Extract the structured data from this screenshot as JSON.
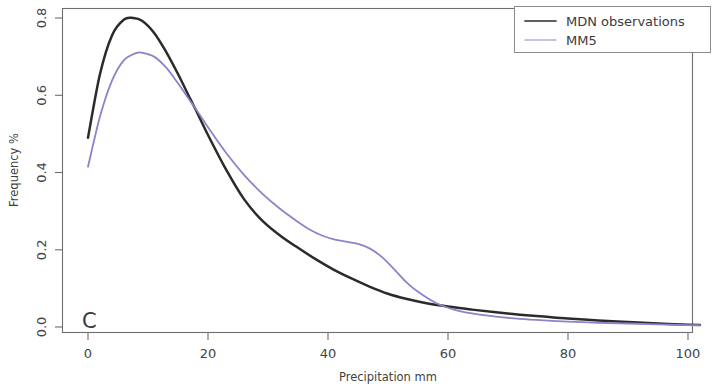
{
  "chart_data": {
    "type": "line",
    "title": "",
    "panel_label": "C",
    "xlabel": "Precipitation mm",
    "ylabel": "Frequency %",
    "xlim": [
      -2,
      104
    ],
    "ylim": [
      -0.02,
      0.84
    ],
    "xticks": [
      0,
      20,
      40,
      60,
      80,
      100
    ],
    "xtick_labels": [
      "0",
      "20",
      "40",
      "60",
      "80",
      "100"
    ],
    "yticks": [
      0.0,
      0.2,
      0.4,
      0.6,
      0.8
    ],
    "ytick_labels": [
      "0.0",
      "0.2",
      "0.4",
      "0.6",
      "0.8"
    ],
    "grid": false,
    "legend_position": "top-right",
    "series": [
      {
        "name": "MDN observations",
        "color": "#2b2b2b",
        "width": 2.5,
        "x": [
          0,
          2,
          4,
          6,
          7.5,
          9,
          11,
          13,
          15,
          17,
          18,
          20,
          23,
          26,
          29,
          32,
          35,
          38,
          41,
          44,
          47,
          50,
          53,
          56,
          60,
          64,
          68,
          72,
          76,
          80,
          85,
          90,
          95,
          100,
          102
        ],
        "y": [
          0.49,
          0.655,
          0.755,
          0.796,
          0.8,
          0.793,
          0.762,
          0.713,
          0.655,
          0.592,
          0.561,
          0.497,
          0.408,
          0.331,
          0.276,
          0.237,
          0.205,
          0.175,
          0.148,
          0.125,
          0.104,
          0.086,
          0.073,
          0.063,
          0.053,
          0.045,
          0.038,
          0.032,
          0.027,
          0.022,
          0.017,
          0.013,
          0.009,
          0.006,
          0.005
        ]
      },
      {
        "name": "MM5",
        "color": "#8a84c8",
        "width": 1.8,
        "x": [
          0,
          2,
          4,
          6,
          8,
          9,
          11,
          13,
          15,
          17,
          18,
          20,
          23,
          26,
          29,
          32,
          35,
          37,
          39,
          41,
          43,
          45,
          47,
          49,
          51,
          53,
          55,
          58,
          61,
          64,
          68,
          72,
          76,
          80,
          85,
          90,
          95,
          100,
          102
        ],
        "y": [
          0.415,
          0.545,
          0.638,
          0.691,
          0.709,
          0.71,
          0.7,
          0.672,
          0.631,
          0.586,
          0.564,
          0.517,
          0.451,
          0.394,
          0.346,
          0.306,
          0.272,
          0.252,
          0.237,
          0.227,
          0.221,
          0.215,
          0.203,
          0.181,
          0.15,
          0.117,
          0.091,
          0.062,
          0.045,
          0.035,
          0.027,
          0.021,
          0.017,
          0.014,
          0.011,
          0.009,
          0.007,
          0.005,
          0.005
        ]
      }
    ]
  },
  "legend": {
    "entries": [
      {
        "label": "MDN observations"
      },
      {
        "label": "MM5"
      }
    ]
  },
  "axes": {
    "x_title": "Precipitation mm",
    "y_title": "Frequency %",
    "x_labels": [
      "0",
      "20",
      "40",
      "60",
      "80",
      "100"
    ],
    "y_labels": [
      "0.0",
      "0.2",
      "0.4",
      "0.6",
      "0.8"
    ]
  },
  "panel": {
    "letter": "C"
  }
}
